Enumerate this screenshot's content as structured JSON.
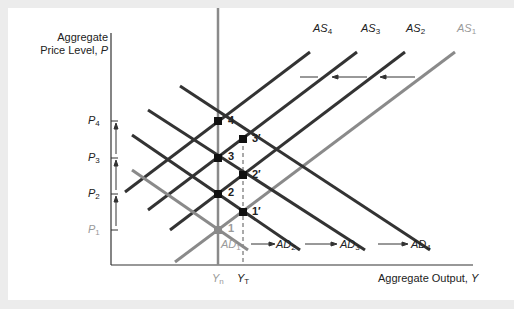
{
  "diagram": {
    "y_axis_label_line1": "Aggregate",
    "y_axis_label_line2": "Price Level, ",
    "y_axis_var": "P",
    "x_axis_label": "Aggregate Output, ",
    "x_axis_var": "Y",
    "price_levels": [
      {
        "sym": "P",
        "sub": "4",
        "y": 121
      },
      {
        "sym": "P",
        "sub": "3",
        "y": 158
      },
      {
        "sym": "P",
        "sub": "2",
        "y": 194
      },
      {
        "sym": "P",
        "sub": "1",
        "y": 230
      }
    ],
    "output_levels": [
      {
        "sym": "Y",
        "sub": "n",
        "x": 218
      },
      {
        "sym": "Y",
        "sub": "T",
        "x": 243
      }
    ],
    "as_curves": [
      {
        "sym": "AS",
        "sub": "4"
      },
      {
        "sym": "AS",
        "sub": "3"
      },
      {
        "sym": "AS",
        "sub": "2"
      },
      {
        "sym": "AS",
        "sub": "1"
      }
    ],
    "ad_curves": [
      {
        "sym": "AD",
        "sub": "1"
      },
      {
        "sym": "AD",
        "sub": "2"
      },
      {
        "sym": "AD",
        "sub": "3"
      },
      {
        "sym": "AD",
        "sub": "4"
      }
    ],
    "points": [
      "1",
      "2",
      "3",
      "4",
      "1′",
      "2′",
      "3′"
    ],
    "colors": {
      "dark": "#333333",
      "gray": "#8a8a8a",
      "light": "#9a9a9a"
    }
  }
}
